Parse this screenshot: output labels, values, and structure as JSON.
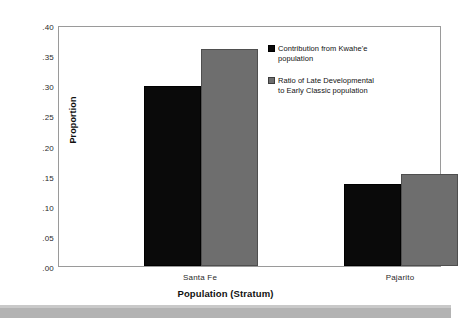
{
  "chart_data": {
    "type": "bar",
    "title": "",
    "xlabel": "Population (Stratum)",
    "ylabel": "Proportion",
    "categories": [
      "Santa Fe",
      "Pajarito"
    ],
    "series": [
      {
        "name": "Contribution from Kwahe'e population",
        "color": "#0a0a0a",
        "values": [
          0.298,
          0.136
        ]
      },
      {
        "name": "Ratio of Late Developmental to Early Classic population",
        "color": "#6e6e6e",
        "values": [
          0.36,
          0.153
        ]
      }
    ],
    "ylim": [
      0.0,
      0.4
    ],
    "ytick_labels": [
      ".00",
      ".05",
      ".10",
      ".15",
      ".20",
      ".25",
      ".30",
      ".35",
      ".40"
    ],
    "ytick_values": [
      0.0,
      0.05,
      0.1,
      0.15,
      0.2,
      0.25,
      0.3,
      0.35,
      0.4
    ],
    "grid": false,
    "legend_position": "inside-upper-right"
  },
  "legend": {
    "entries": [
      {
        "swatch": "black-square-icon",
        "line1": "Contribution from Kwahe'e",
        "line2": "population"
      },
      {
        "swatch": "grey-square-icon",
        "line1": "Ratio of Late Developmental",
        "line2": "to Early Classic population"
      }
    ]
  },
  "axes": {
    "y_title": "Proportion",
    "x_title": "Population (Stratum)"
  },
  "colors": {
    "series_black": "#0a0a0a",
    "series_grey": "#6e6e6e",
    "frame": "#9a9a9a",
    "page_band": "#b3b3b3"
  }
}
